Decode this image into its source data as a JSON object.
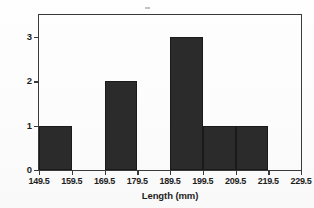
{
  "chart_data": {
    "type": "bar",
    "title": "",
    "subtitle": "",
    "xlabel": "Length (mm)",
    "ylabel": "Frequency",
    "xlim": [
      149.5,
      229.5
    ],
    "ylim": [
      0,
      3.5
    ],
    "grid": false,
    "legend": null,
    "bin_width": 10,
    "bin_edges": [
      149.5,
      159.5,
      169.5,
      179.5,
      189.5,
      199.5,
      209.5,
      219.5,
      229.5
    ],
    "categories": [
      "149.5-159.5",
      "159.5-169.5",
      "169.5-179.5",
      "179.5-189.5",
      "189.5-199.5",
      "199.5-209.5",
      "209.5-219.5",
      "219.5-229.5"
    ],
    "values": [
      1,
      0,
      2,
      0,
      3,
      1,
      1,
      0
    ],
    "bar_color": "#2b2b2b",
    "frame_color": "#3a3a3a",
    "background_color": "#fdfdfd",
    "xticks": [
      "149.5",
      "159.5",
      "169.5",
      "179.5",
      "189.5",
      "199.5",
      "209.5",
      "219.5",
      "229.5"
    ],
    "xtick_values": [
      149.5,
      159.5,
      169.5,
      179.5,
      189.5,
      199.5,
      209.5,
      219.5,
      229.5
    ],
    "yticks": [
      "0",
      "1",
      "2",
      "3"
    ],
    "ytick_values": [
      0,
      1,
      2,
      3
    ],
    "annotations": []
  }
}
